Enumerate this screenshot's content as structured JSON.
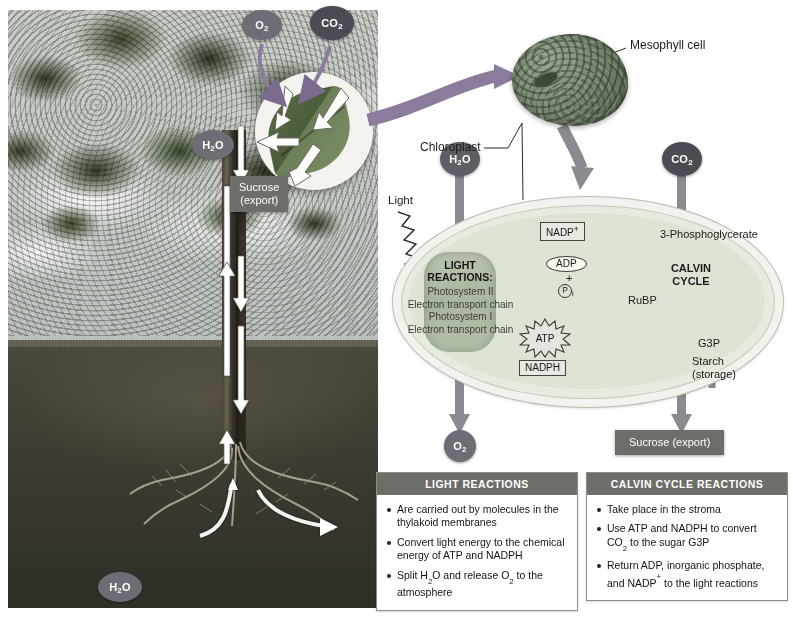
{
  "colors": {
    "arrow_purple": "#7b6b8e",
    "arrow_gray": "#6f6f78",
    "molecule_bubble": "#5d5d66",
    "box_header": "#6e6e68",
    "chloroplast_stroma": "#dde4d6",
    "white_arrow": "#ffffff",
    "text": "#1b1b1b"
  },
  "photo_scene": {
    "name": "tree-photosynthesis-photo",
    "molecules": [
      {
        "id": "o2-leaf",
        "label": "O2",
        "formula_base": "O",
        "formula_sub": "2"
      },
      {
        "id": "co2-leaf",
        "label": "CO2",
        "formula_base": "CO",
        "formula_sub": "2"
      },
      {
        "id": "h2o-leaf",
        "label": "H2O",
        "formula_base": "H",
        "formula_sub": "2",
        "formula_tail": "O"
      },
      {
        "id": "h2o-root",
        "label": "H2O",
        "formula_base": "H",
        "formula_sub": "2",
        "formula_tail": "O"
      }
    ],
    "sucrose_label_line1": "Sucrose",
    "sucrose_label_line2": "(export)"
  },
  "cell": {
    "mesophyll_label": "Mesophyll cell",
    "chloroplast_label": "Chloroplast"
  },
  "chloroplast": {
    "light_label": "Light",
    "inputs": [
      {
        "id": "h2o-input",
        "base": "H",
        "sub": "2",
        "tail": "O"
      },
      {
        "id": "co2-input",
        "base": "CO",
        "sub": "2",
        "tail": ""
      }
    ],
    "outputs": [
      {
        "id": "o2-output",
        "base": "O",
        "sub": "2",
        "tail": ""
      }
    ],
    "light_reactions": {
      "title_line1": "LIGHT",
      "title_line2": "REACTIONS:",
      "steps": [
        "Photosystem II",
        "Electron transport chain",
        "Photosystem I",
        "Electron transport chain"
      ]
    },
    "exchange_labels": {
      "nadp_plus_base": "NADP",
      "nadp_plus_sup": "+",
      "adp": "ADP",
      "plus": "+",
      "pi_circle": "P",
      "pi_sub": "i",
      "atp": "ATP",
      "nadph": "NADPH"
    },
    "calvin": {
      "title_line1": "CALVIN",
      "title_line2": "CYCLE",
      "rubp": "RuBP",
      "pga": "3-Phosphoglycerate",
      "g3p": "G3P",
      "starch_line1": "Starch",
      "starch_line2": "(storage)"
    },
    "sucrose_output": "Sucrose (export)"
  },
  "summary_boxes": [
    {
      "id": "light-reactions-summary",
      "header": "LIGHT REACTIONS",
      "items": [
        {
          "parts": [
            {
              "t": "Are carried out by molecules in the thylakoid membranes"
            }
          ]
        },
        {
          "parts": [
            {
              "t": "Convert light energy to the chemical energy of ATP and NADPH"
            }
          ]
        },
        {
          "parts": [
            {
              "t": "Split H"
            },
            {
              "sub": "2"
            },
            {
              "t": "O and release O"
            },
            {
              "sub": "2"
            },
            {
              "t": " to the atmosphere"
            }
          ]
        }
      ]
    },
    {
      "id": "calvin-cycle-summary",
      "header": "CALVIN CYCLE REACTIONS",
      "items": [
        {
          "parts": [
            {
              "t": "Take place in the stroma"
            }
          ]
        },
        {
          "parts": [
            {
              "t": "Use ATP and NADPH to convert CO"
            },
            {
              "sub": "2"
            },
            {
              "t": " to the sugar G3P"
            }
          ]
        },
        {
          "parts": [
            {
              "t": "Return ADP, inorganic phosphate, and NADP"
            },
            {
              "sup": "+"
            },
            {
              "t": " to the light reactions"
            }
          ]
        }
      ]
    }
  ]
}
